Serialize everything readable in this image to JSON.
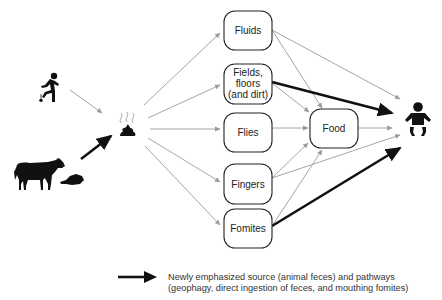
{
  "diagram": {
    "sources": [
      {
        "id": "human",
        "icon": "squatting-person-icon"
      },
      {
        "id": "animal",
        "icon": "cow-icon"
      },
      {
        "id": "animal-dung",
        "icon": "dung-patty-icon"
      }
    ],
    "hub": {
      "id": "feces",
      "icon": "steaming-feces-icon"
    },
    "pathways": [
      {
        "id": "fluids",
        "label": [
          "Fluids"
        ]
      },
      {
        "id": "fields",
        "label": [
          "Fields,",
          "floors",
          "(and dirt)"
        ]
      },
      {
        "id": "flies",
        "label": [
          "Flies"
        ]
      },
      {
        "id": "fingers",
        "label": [
          "Fingers"
        ]
      },
      {
        "id": "fomites",
        "label": [
          "Fomites"
        ]
      }
    ],
    "food": {
      "label": "Food"
    },
    "target": {
      "id": "child",
      "icon": "baby-icon"
    },
    "edges": [
      {
        "from": "human",
        "to": "feces",
        "emphasized": false
      },
      {
        "from": "animal",
        "to": "feces",
        "emphasized": true
      },
      {
        "from": "feces",
        "to": "fluids",
        "emphasized": false
      },
      {
        "from": "feces",
        "to": "fields",
        "emphasized": false
      },
      {
        "from": "feces",
        "to": "flies",
        "emphasized": false
      },
      {
        "from": "feces",
        "to": "fingers",
        "emphasized": false
      },
      {
        "from": "feces",
        "to": "fomites",
        "emphasized": false
      },
      {
        "from": "fluids",
        "to": "child",
        "emphasized": false
      },
      {
        "from": "fluids",
        "to": "food",
        "emphasized": false
      },
      {
        "from": "fields",
        "to": "child",
        "emphasized": true
      },
      {
        "from": "fields",
        "to": "food",
        "emphasized": false
      },
      {
        "from": "flies",
        "to": "food",
        "emphasized": false
      },
      {
        "from": "fingers",
        "to": "food",
        "emphasized": false
      },
      {
        "from": "fingers",
        "to": "child",
        "emphasized": false
      },
      {
        "from": "fomites",
        "to": "food",
        "emphasized": false
      },
      {
        "from": "fomites",
        "to": "child",
        "emphasized": true
      },
      {
        "from": "food",
        "to": "child",
        "emphasized": false
      }
    ]
  },
  "legend": {
    "line1": "Newly emphasized source (animal feces) and pathways",
    "line2": "(geophagy, direct ingestion of feces, and mouthing fomites)"
  },
  "colors": {
    "thin_arrow": "#9a9a9a",
    "thick_arrow": "#111111",
    "box_stroke": "#222222"
  }
}
